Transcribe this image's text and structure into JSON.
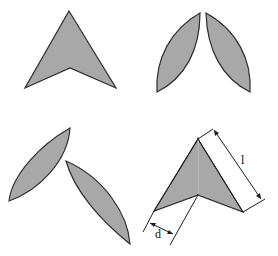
{
  "figure": {
    "panels": [
      {
        "id": "top-left",
        "description": "flat arrowhead (chevron) shape"
      },
      {
        "id": "top-right",
        "description": "two lens-shaped (vesica) halves split apart"
      },
      {
        "id": "bottom-left",
        "description": "two lens-shaped halves rotated apart"
      },
      {
        "id": "bottom-right",
        "description": "folded arrowhead with dimension annotations"
      }
    ],
    "labels": {
      "length": "l",
      "width": "d"
    },
    "colors": {
      "fill": "#a8a8a8",
      "stroke": "#2e2e2e",
      "background": "#ffffff"
    }
  }
}
